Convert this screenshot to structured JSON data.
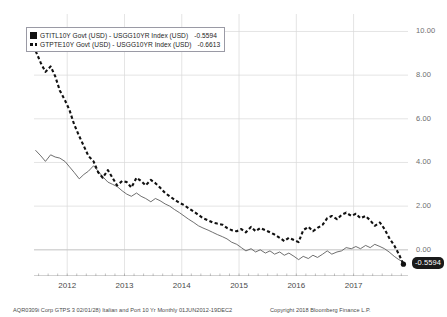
{
  "chart_data": {
    "type": "line",
    "title": "",
    "xlabel": "",
    "ylabel": "",
    "ylim": [
      -1.2,
      10.8
    ],
    "xlim": [
      2011.42,
      2017.95
    ],
    "grid": true,
    "legend_position": "top-left",
    "y_ticks": [
      "10.00",
      "8.00",
      "6.00",
      "4.00",
      "2.00",
      "0.00"
    ],
    "y_tick_values": [
      10,
      8,
      6,
      4,
      2,
      0
    ],
    "x_ticks": [
      "2012",
      "2013",
      "2014",
      "2015",
      "2016",
      "2017"
    ],
    "x_tick_values": [
      2012,
      2013,
      2014,
      2015,
      2016,
      2017
    ],
    "last_value_label": "-0.5594",
    "series": [
      {
        "name": "GTITL10Y Govt (USD) - USGG10YR Index (USD)",
        "short_name": "Italy 10Y spread vs US 10Y",
        "style": "solid",
        "color": "#555555",
        "last_value": "-0.5594",
        "x": [
          2011.45,
          2011.54,
          2011.62,
          2011.71,
          2011.79,
          2011.87,
          2011.96,
          2012.04,
          2012.12,
          2012.21,
          2012.29,
          2012.37,
          2012.46,
          2012.54,
          2012.62,
          2012.71,
          2012.79,
          2012.87,
          2012.96,
          2013.04,
          2013.12,
          2013.21,
          2013.29,
          2013.37,
          2013.46,
          2013.54,
          2013.62,
          2013.71,
          2013.79,
          2013.87,
          2013.96,
          2014.04,
          2014.12,
          2014.21,
          2014.29,
          2014.37,
          2014.46,
          2014.54,
          2014.62,
          2014.71,
          2014.79,
          2014.87,
          2014.96,
          2015.04,
          2015.12,
          2015.21,
          2015.29,
          2015.37,
          2015.46,
          2015.54,
          2015.62,
          2015.71,
          2015.79,
          2015.87,
          2015.96,
          2016.04,
          2016.12,
          2016.21,
          2016.29,
          2016.37,
          2016.46,
          2016.54,
          2016.62,
          2016.71,
          2016.79,
          2016.87,
          2016.96,
          2017.04,
          2017.12,
          2017.21,
          2017.29,
          2017.37,
          2017.46,
          2017.54,
          2017.62,
          2017.71,
          2017.79,
          2017.87
        ],
        "values": [
          4.55,
          4.3,
          4.05,
          4.35,
          4.25,
          4.2,
          4.05,
          3.8,
          3.55,
          3.25,
          3.45,
          3.6,
          3.85,
          3.6,
          3.35,
          3.1,
          3.0,
          2.9,
          2.7,
          2.55,
          2.45,
          2.6,
          2.45,
          2.35,
          2.2,
          2.35,
          2.25,
          2.1,
          2.0,
          1.85,
          1.7,
          1.55,
          1.4,
          1.25,
          1.1,
          1.0,
          0.9,
          0.8,
          0.7,
          0.6,
          0.5,
          0.35,
          0.25,
          0.1,
          -0.05,
          0.05,
          -0.1,
          0.0,
          -0.15,
          -0.05,
          -0.2,
          -0.1,
          -0.25,
          -0.15,
          -0.3,
          -0.45,
          -0.3,
          -0.4,
          -0.25,
          -0.35,
          -0.2,
          -0.05,
          -0.2,
          -0.1,
          -0.05,
          0.1,
          0.05,
          0.15,
          0.05,
          0.2,
          0.1,
          0.25,
          0.15,
          0.05,
          -0.1,
          -0.3,
          -0.45,
          -0.56
        ]
      },
      {
        "name": "GTPTE10Y Govt (USD) - USGG10YR Index (USD)",
        "short_name": "Portugal 10Y spread vs US 10Y",
        "style": "dashed",
        "color": "#111111",
        "last_value": "-0.6613",
        "x": [
          2011.45,
          2011.54,
          2011.62,
          2011.71,
          2011.79,
          2011.87,
          2011.96,
          2012.04,
          2012.12,
          2012.21,
          2012.29,
          2012.37,
          2012.46,
          2012.54,
          2012.62,
          2012.71,
          2012.79,
          2012.87,
          2012.96,
          2013.04,
          2013.12,
          2013.21,
          2013.29,
          2013.37,
          2013.46,
          2013.54,
          2013.62,
          2013.71,
          2013.79,
          2013.87,
          2013.96,
          2014.04,
          2014.12,
          2014.21,
          2014.29,
          2014.37,
          2014.46,
          2014.54,
          2014.62,
          2014.71,
          2014.79,
          2014.87,
          2014.96,
          2015.04,
          2015.12,
          2015.21,
          2015.29,
          2015.37,
          2015.46,
          2015.54,
          2015.62,
          2015.71,
          2015.79,
          2015.87,
          2015.96,
          2016.04,
          2016.12,
          2016.21,
          2016.29,
          2016.37,
          2016.46,
          2016.54,
          2016.62,
          2016.71,
          2016.79,
          2016.87,
          2016.96,
          2017.04,
          2017.12,
          2017.21,
          2017.29,
          2017.37,
          2017.46,
          2017.54,
          2017.62,
          2017.71,
          2017.79,
          2017.87
        ],
        "values": [
          9.1,
          8.55,
          8.15,
          8.4,
          7.95,
          7.3,
          6.85,
          6.4,
          5.75,
          5.2,
          4.75,
          4.3,
          4.05,
          3.55,
          3.3,
          3.65,
          3.3,
          2.95,
          3.15,
          3.1,
          2.85,
          3.3,
          3.15,
          2.95,
          3.2,
          3.05,
          2.85,
          2.6,
          2.45,
          2.3,
          2.15,
          2.05,
          1.9,
          1.75,
          1.6,
          1.45,
          1.35,
          1.25,
          1.2,
          1.15,
          1.0,
          0.9,
          0.85,
          0.95,
          0.8,
          1.05,
          0.85,
          1.0,
          0.9,
          0.8,
          0.7,
          0.55,
          0.4,
          0.55,
          0.45,
          0.35,
          0.9,
          1.05,
          0.85,
          1.0,
          1.15,
          1.45,
          1.55,
          1.4,
          1.6,
          1.7,
          1.55,
          1.65,
          1.45,
          1.55,
          1.35,
          1.1,
          1.25,
          0.95,
          0.55,
          0.2,
          -0.2,
          -0.66
        ]
      }
    ]
  },
  "axis": {
    "y_labels": [
      "10.00",
      "8.00",
      "6.00",
      "4.00",
      "2.00",
      "0.00"
    ],
    "x_labels": [
      "2012",
      "2013",
      "2014",
      "2015",
      "2016",
      "2017"
    ]
  },
  "badge": {
    "value": "-0.5594"
  },
  "legend": {
    "rows": [
      {
        "key": "solid-square-marker",
        "label": "GTITL10Y Govt (USD)  -  USGG10YR Index (USD)",
        "value": "-0.5594"
      },
      {
        "key": "dashed-line-marker",
        "label": "GTPTE10Y Govt (USD)  -  USGG10YR Index (USD)",
        "value": "-0.6613"
      }
    ]
  },
  "footer": {
    "left": "AQR0309i Corp GTPS 3 02/01/28) Italian and Port 10 Yr  Monthly 01JUN2012-19DEC2",
    "right": "Copyright 2018 Bloomberg Finance L.P."
  }
}
